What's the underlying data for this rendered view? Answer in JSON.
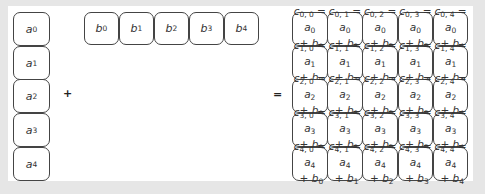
{
  "diagram": {
    "operators": {
      "plus": "+",
      "equals": "="
    },
    "vector_a": {
      "symbol": "a",
      "items": [
        {
          "sym": "a",
          "idx": "0"
        },
        {
          "sym": "a",
          "idx": "1"
        },
        {
          "sym": "a",
          "idx": "2"
        },
        {
          "sym": "a",
          "idx": "3"
        },
        {
          "sym": "a",
          "idx": "4"
        }
      ]
    },
    "vector_b": {
      "symbol": "b",
      "items": [
        {
          "sym": "b",
          "idx": "0"
        },
        {
          "sym": "b",
          "idx": "1"
        },
        {
          "sym": "b",
          "idx": "2"
        },
        {
          "sym": "b",
          "idx": "3"
        },
        {
          "sym": "b",
          "idx": "4"
        }
      ]
    },
    "matrix_c": {
      "rows": [
        [
          {
            "c": "0, 0",
            "a": "0",
            "b": "0"
          },
          {
            "c": "0, 1",
            "a": "0",
            "b": "1"
          },
          {
            "c": "0, 2",
            "a": "0",
            "b": "2"
          },
          {
            "c": "0, 3",
            "a": "0",
            "b": "3"
          },
          {
            "c": "0, 4",
            "a": "0",
            "b": "4"
          }
        ],
        [
          {
            "c": "1, 0",
            "a": "1",
            "b": "0"
          },
          {
            "c": "1, 1",
            "a": "1",
            "b": "1"
          },
          {
            "c": "1, 2",
            "a": "1",
            "b": "2"
          },
          {
            "c": "1, 3",
            "a": "1",
            "b": "3"
          },
          {
            "c": "1, 4",
            "a": "1",
            "b": "4"
          }
        ],
        [
          {
            "c": "2, 0",
            "a": "2",
            "b": "0"
          },
          {
            "c": "2, 1",
            "a": "2",
            "b": "1"
          },
          {
            "c": "2, 2",
            "a": "2",
            "b": "2"
          },
          {
            "c": "2, 3",
            "a": "2",
            "b": "3"
          },
          {
            "c": "2, 4",
            "a": "2",
            "b": "4"
          }
        ],
        [
          {
            "c": "3, 0",
            "a": "3",
            "b": "0"
          },
          {
            "c": "3, 1",
            "a": "3",
            "b": "1"
          },
          {
            "c": "3, 2",
            "a": "3",
            "b": "2"
          },
          {
            "c": "3, 3",
            "a": "3",
            "b": "3"
          },
          {
            "c": "3, 4",
            "a": "3",
            "b": "4"
          }
        ],
        [
          {
            "c": "4, 0",
            "a": "4",
            "b": "0"
          },
          {
            "c": "4, 1",
            "a": "4",
            "b": "1"
          },
          {
            "c": "4, 2",
            "a": "4",
            "b": "2"
          },
          {
            "c": "4, 3",
            "a": "4",
            "b": "3"
          },
          {
            "c": "4, 4",
            "a": "4",
            "b": "4"
          }
        ]
      ],
      "cell_symbol": "c",
      "eq": " =",
      "plus": " + "
    }
  }
}
